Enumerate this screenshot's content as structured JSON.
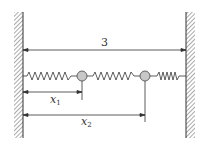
{
  "diagram": {
    "total_length_label": "3",
    "x1_label": "x",
    "x1_sub": "1",
    "x2_label": "x",
    "x2_sub": "2",
    "colors": {
      "line": "#333333",
      "mass": "#c8c8c8",
      "hatch": "#555555"
    }
  }
}
